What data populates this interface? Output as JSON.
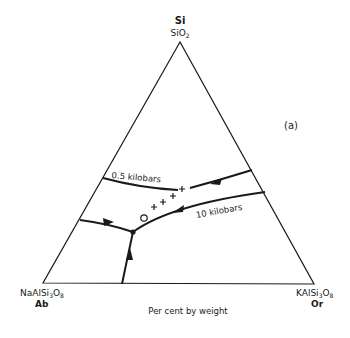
{
  "diagram": {
    "type": "ternary-phase-diagram",
    "panel_label": "(a)",
    "axis_caption": "Per cent by weight",
    "vertices": {
      "top": {
        "element": "Si",
        "formula_main": "SiO",
        "formula_sub": "2"
      },
      "left": {
        "formula_parts": [
          "NaAlSi",
          "3",
          "O",
          "8"
        ],
        "abbrev": "Ab"
      },
      "right": {
        "formula_parts": [
          "KAlSi",
          "3",
          "O",
          "8"
        ],
        "abbrev": "Or"
      }
    },
    "curves": [
      {
        "label": "0.5 kilobars"
      },
      {
        "label": "10 kilobars"
      }
    ],
    "markers": {
      "plus_count": 4,
      "circle_count": 1
    },
    "colors": {
      "line": "#1a1a1a",
      "background": "#ffffff"
    }
  }
}
